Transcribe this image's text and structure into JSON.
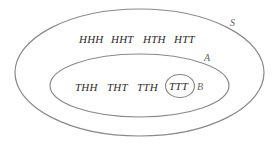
{
  "diagram": {
    "type": "venn",
    "sets": {
      "S": {
        "label": "S",
        "outcomes_outside_A": [
          "HHH",
          "HHT",
          "HTH",
          "HTT"
        ]
      },
      "A": {
        "label": "A",
        "outcomes_outside_B": [
          "THH",
          "THT",
          "TTH"
        ]
      },
      "B": {
        "label": "B",
        "outcomes": [
          "TTT"
        ]
      }
    },
    "colors": {
      "stroke": "#8a8a8a",
      "text": "#2a2a2a",
      "label": "#666666",
      "background": "#ffffff"
    }
  }
}
